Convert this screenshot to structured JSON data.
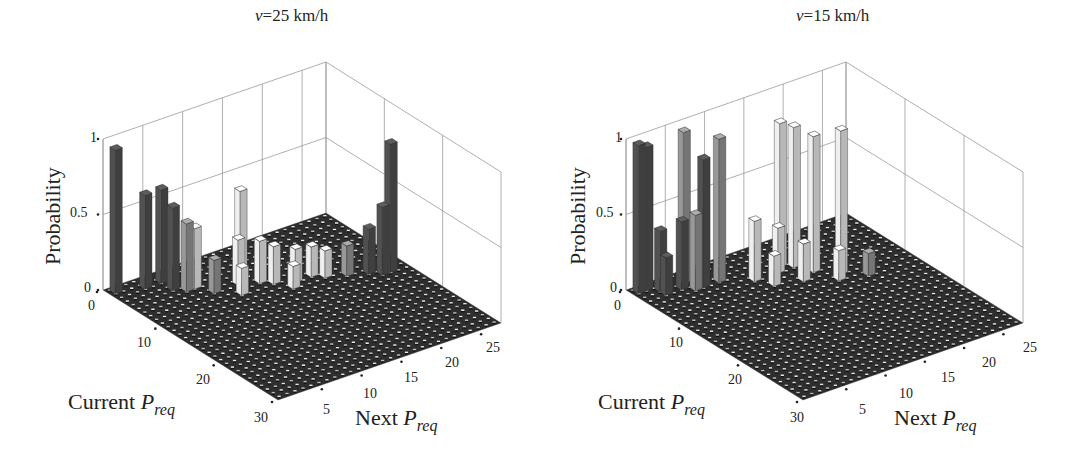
{
  "chart_data": [
    {
      "type": "bar3d",
      "title_var": "v",
      "title_rest": "=25 km/h",
      "title": "v=25 km/h",
      "zlabel": "Probability",
      "xlabel_main": "Current ",
      "xlabel_sym": "P",
      "xlabel_sub": "req",
      "ylabel_main": "Next ",
      "ylabel_sym": "P",
      "ylabel_sub": "req",
      "xlabel": "Current P_req",
      "ylabel": "Next P_req",
      "zlim": [
        0,
        1
      ],
      "z_ticks": [
        "0",
        "0.5",
        "1"
      ],
      "current_ticks": [
        "0",
        "10",
        "20",
        "30"
      ],
      "next_ticks": [
        "5",
        "10",
        "15",
        "20",
        "25"
      ],
      "grid": true,
      "bars": [
        {
          "current": 1,
          "next": 1,
          "p": 0.95,
          "shade": "dark"
        },
        {
          "current": 2,
          "next": 4,
          "p": 0.62,
          "shade": "dark"
        },
        {
          "current": 2,
          "next": 6,
          "p": 0.62,
          "shade": "dark"
        },
        {
          "current": 4,
          "next": 6,
          "p": 0.55,
          "shade": "dark"
        },
        {
          "current": 5,
          "next": 7,
          "p": 0.45,
          "shade": "mid"
        },
        {
          "current": 5,
          "next": 8,
          "p": 0.4,
          "shade": "light"
        },
        {
          "current": 6,
          "next": 13,
          "p": 0.58,
          "shade": "light"
        },
        {
          "current": 7,
          "next": 12,
          "p": 0.3,
          "shade": "light"
        },
        {
          "current": 8,
          "next": 14,
          "p": 0.28,
          "shade": "light"
        },
        {
          "current": 9,
          "next": 15,
          "p": 0.25,
          "shade": "light"
        },
        {
          "current": 10,
          "next": 17,
          "p": 0.22,
          "shade": "light"
        },
        {
          "current": 10,
          "next": 19,
          "p": 0.2,
          "shade": "light"
        },
        {
          "current": 11,
          "next": 20,
          "p": 0.18,
          "shade": "light"
        },
        {
          "current": 12,
          "next": 22,
          "p": 0.2,
          "shade": "mid"
        },
        {
          "current": 13,
          "next": 24,
          "p": 0.3,
          "shade": "dark"
        },
        {
          "current": 14,
          "next": 26,
          "p": 0.85,
          "shade": "dark"
        },
        {
          "current": 14,
          "next": 25,
          "p": 0.45,
          "shade": "dark"
        },
        {
          "current": 7,
          "next": 9,
          "p": 0.22,
          "shade": "mid"
        },
        {
          "current": 9,
          "next": 11,
          "p": 0.18,
          "shade": "light"
        },
        {
          "current": 11,
          "next": 16,
          "p": 0.15,
          "shade": "light"
        }
      ]
    },
    {
      "type": "bar3d",
      "title_var": "v",
      "title_rest": "=15 km/h",
      "title": "v=15 km/h",
      "zlabel": "Probability",
      "xlabel_main": "Current ",
      "xlabel_sym": "P",
      "xlabel_sub": "req",
      "ylabel_main": "Next ",
      "ylabel_sym": "P",
      "ylabel_sub": "req",
      "xlabel": "Current P_req",
      "ylabel": "Next P_req",
      "zlim": [
        0,
        1
      ],
      "z_ticks": [
        "0",
        "0.5",
        "1"
      ],
      "current_ticks": [
        "0",
        "10",
        "20",
        "30"
      ],
      "next_ticks": [
        "5",
        "10",
        "15",
        "20",
        "25"
      ],
      "grid": true,
      "bars": [
        {
          "current": 1,
          "next": 1,
          "p": 0.98,
          "shade": "dark"
        },
        {
          "current": 1,
          "next": 2,
          "p": 0.95,
          "shade": "dark"
        },
        {
          "current": 2,
          "next": 3,
          "p": 0.4,
          "shade": "dark"
        },
        {
          "current": 3,
          "next": 3,
          "p": 0.25,
          "shade": "dark"
        },
        {
          "current": 3,
          "next": 5,
          "p": 0.45,
          "shade": "dark"
        },
        {
          "current": 2,
          "next": 6,
          "p": 1.0,
          "shade": "mid"
        },
        {
          "current": 4,
          "next": 6,
          "p": 0.5,
          "shade": "mid"
        },
        {
          "current": 4,
          "next": 7,
          "p": 0.85,
          "shade": "dark"
        },
        {
          "current": 4,
          "next": 9,
          "p": 0.95,
          "shade": "mid"
        },
        {
          "current": 6,
          "next": 12,
          "p": 0.4,
          "shade": "light"
        },
        {
          "current": 5,
          "next": 16,
          "p": 0.95,
          "shade": "light"
        },
        {
          "current": 6,
          "next": 17,
          "p": 0.93,
          "shade": "light"
        },
        {
          "current": 8,
          "next": 18,
          "p": 0.9,
          "shade": "light"
        },
        {
          "current": 6,
          "next": 15,
          "p": 0.3,
          "shade": "light"
        },
        {
          "current": 10,
          "next": 20,
          "p": 0.95,
          "shade": "light"
        },
        {
          "current": 9,
          "next": 16,
          "p": 0.25,
          "shade": "light"
        },
        {
          "current": 11,
          "next": 19,
          "p": 0.2,
          "shade": "light"
        },
        {
          "current": 8,
          "next": 13,
          "p": 0.2,
          "shade": "light"
        },
        {
          "current": 12,
          "next": 22,
          "p": 0.15,
          "shade": "mid"
        }
      ]
    }
  ],
  "colors": {
    "dark": "#4a4a4a",
    "mid": "#8a8a8a",
    "light": "#d9d9d9",
    "floor": "#2e2e2e",
    "grid": "#9a9a9a"
  }
}
